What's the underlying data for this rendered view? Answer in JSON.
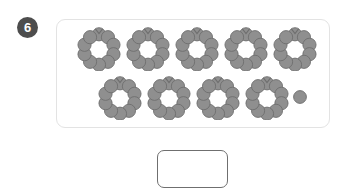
{
  "question": {
    "number": "6",
    "badge_color": "#4d4d4d",
    "badge_text_color": "#ffffff"
  },
  "panel": {
    "border_color": "#e3e3e3",
    "background": "#ffffff"
  },
  "counters": {
    "dot_fill": "#8f8f8f",
    "dot_stroke": "#6e6e6e",
    "dots_per_bundle": 10,
    "bundles_total": 9,
    "loose_dots": 1,
    "represented_number": 91,
    "rows": [
      {
        "name": "top-row",
        "bundles": 5,
        "loose": 0
      },
      {
        "name": "bottom-row",
        "bundles": 4,
        "loose": 1
      }
    ]
  },
  "answer": {
    "value": "",
    "placeholder": "",
    "border_color": "#6f6f6f"
  }
}
